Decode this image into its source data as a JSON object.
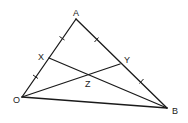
{
  "diagram": {
    "type": "triangle-geometry",
    "points": {
      "A": {
        "label": "A",
        "x": 76,
        "y": 19
      },
      "O": {
        "label": "O",
        "x": 22,
        "y": 97
      },
      "B": {
        "label": "B",
        "x": 167,
        "y": 108
      },
      "X": {
        "label": "X",
        "x": 49,
        "y": 58
      },
      "Y": {
        "label": "Y",
        "x": 120,
        "y": 64
      },
      "Z": {
        "label": "Z",
        "x": 89,
        "y": 74
      }
    },
    "segments": [
      "OA",
      "AB",
      "OB",
      "XB",
      "OY"
    ],
    "tick_marks": [
      {
        "segment": "AX",
        "count": 1
      },
      {
        "segment": "XO",
        "count": 1
      },
      {
        "segment": "AY",
        "count": 1
      },
      {
        "segment": "YB",
        "count": 1
      }
    ],
    "line_color": "#1a1a1a",
    "background": "#ffffff"
  }
}
